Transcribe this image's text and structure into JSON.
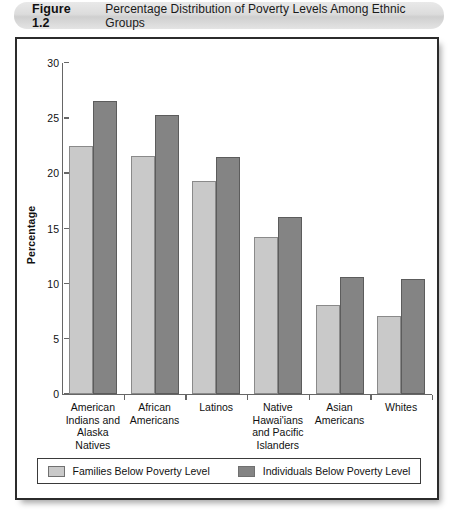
{
  "figure": {
    "label": "Figure 1.2",
    "title": "Percentage Distribution of Poverty Levels Among Ethnic Groups"
  },
  "colors": {
    "families_fill": "#c9c9c9",
    "individuals_fill": "#848484",
    "axis": "#666666",
    "frame": "#2b2b2b",
    "caption_bar": "#dcdcdc"
  },
  "legend": {
    "items": [
      {
        "label": "Families Below Poverty Level",
        "swatch": "families"
      },
      {
        "label": "Individuals Below Poverty Level",
        "swatch": "individuals"
      }
    ]
  },
  "chart_data": {
    "type": "bar",
    "title": "Percentage Distribution of Poverty Levels Among Ethnic Groups",
    "xlabel": "",
    "ylabel": "Percentage",
    "ylim": [
      0,
      30
    ],
    "yticks": [
      0,
      5,
      10,
      15,
      20,
      25,
      30
    ],
    "ytick_labels": [
      "0",
      "5",
      "10",
      "15",
      "20",
      "25",
      "30"
    ],
    "grid": false,
    "legend_position": "bottom",
    "categories": [
      "American Indians and Alaska Natives",
      "African Americans",
      "Latinos",
      "Native Hawai'ians and Pacific Islanders",
      "Asian Americans",
      "Whites"
    ],
    "category_lines": [
      [
        "American",
        "Indians and",
        "Alaska",
        "Natives"
      ],
      [
        "African",
        "Americans"
      ],
      [
        "Latinos"
      ],
      [
        "Native",
        "Hawai'ians",
        "and Pacific",
        "Islanders"
      ],
      [
        "Asian",
        "Americans"
      ],
      [
        "Whites"
      ]
    ],
    "series": [
      {
        "name": "Families Below Poverty Level",
        "values": [
          22.5,
          21.6,
          19.3,
          14.2,
          8.1,
          7.1
        ]
      },
      {
        "name": "Individuals Below Poverty Level",
        "values": [
          26.6,
          25.3,
          21.5,
          16.0,
          10.6,
          10.4
        ]
      }
    ]
  }
}
